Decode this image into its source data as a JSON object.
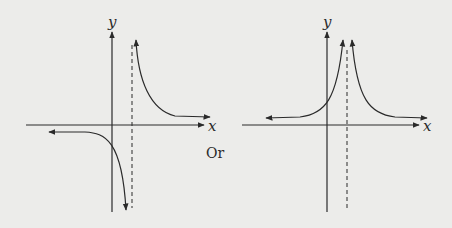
{
  "graphs": [
    {
      "id": "left",
      "x_label": "x",
      "y_label": "y",
      "description": "Odd-type hyperbola: y = k/(x-a) shape with vertical asymptote right of y-axis; branch in quadrant I going up near asymptote and approaching x-axis from above; branch going down near asymptote and approaching a horizontal level below x-axis on the left"
    },
    {
      "id": "right",
      "x_label": "x",
      "y_label": "y",
      "description": "Even-type curve: y = k/(x-a)^2 shape; both branches rise toward vertical asymptote right of y-axis and approach x-axis level from above at both ends"
    }
  ],
  "separator_label": "Or",
  "colors": {
    "ink": "#2a2a2a",
    "background": "#ececea"
  }
}
